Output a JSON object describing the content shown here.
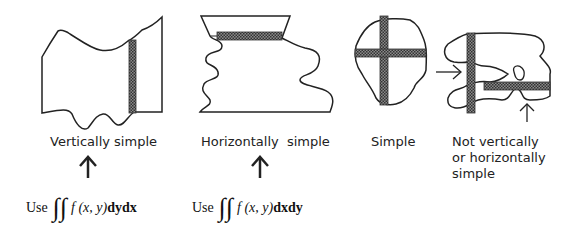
{
  "diagram": {
    "colors": {
      "stroke": "#222222",
      "hatch": "#555555",
      "background": "#ffffff"
    },
    "regions": [
      {
        "id": "vertically-simple",
        "label": "Vertically simple",
        "strip": "vertical"
      },
      {
        "id": "horizontally-simple",
        "label": "Horizontally  simple",
        "strip": "horizontal"
      },
      {
        "id": "simple",
        "label": "Simple",
        "strip": "both"
      },
      {
        "id": "not-simple",
        "label_lines": [
          "Not vertically",
          "or horizontally",
          "simple"
        ],
        "strip": "both"
      }
    ],
    "formulas": [
      {
        "use": "Use",
        "integral": "∫∫",
        "func": "f (x, y)",
        "diff": "dydx"
      },
      {
        "use": "Use",
        "integral": "∫∫",
        "func": "f (x, y)",
        "diff": "dxdy"
      }
    ],
    "arrows": [
      "up-arrow",
      "up-arrow"
    ]
  }
}
